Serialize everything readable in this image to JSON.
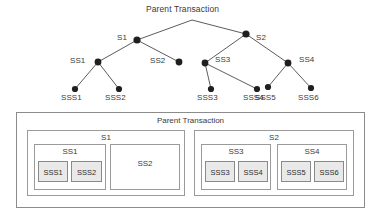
{
  "diagram": {
    "colors": {
      "node_fill": "#1f1f1f",
      "edge": "#4a4a4a",
      "text": "#3a3a3a",
      "box_border": "#8c8c8c",
      "leaf_fill": "#e9e9e9"
    },
    "tree": {
      "root": {
        "label": "Parent Transaction",
        "x": 192,
        "y": 20
      },
      "nodes": [
        {
          "id": "S1",
          "label": "S1",
          "x": 137,
          "y": 40,
          "label_x": 117,
          "label_y": 34
        },
        {
          "id": "S2",
          "label": "S2",
          "x": 246,
          "y": 34,
          "label_x": 256,
          "label_y": 36
        },
        {
          "id": "SS1",
          "label": "SS1",
          "x": 98,
          "y": 62,
          "label_x": 72,
          "label_y": 58
        },
        {
          "id": "SS2",
          "label": "SS2",
          "x": 179,
          "y": 62,
          "label_x": 152,
          "label_y": 58
        },
        {
          "id": "SS3",
          "label": "SS3",
          "x": 205,
          "y": 63,
          "label_x": 216,
          "label_y": 57
        },
        {
          "id": "SS4",
          "label": "SS4",
          "x": 288,
          "y": 63,
          "label_x": 300,
          "label_y": 57
        },
        {
          "id": "SSS1",
          "label": "SSS1",
          "x": 75,
          "y": 89,
          "label_x": 62,
          "label_y": 94
        },
        {
          "id": "SSS2",
          "label": "SSS2",
          "x": 119,
          "y": 89,
          "label_x": 106,
          "label_y": 94
        },
        {
          "id": "SSS3",
          "label": "SSS3",
          "x": 211,
          "y": 89,
          "label_x": 198,
          "label_y": 94
        },
        {
          "id": "SSS4",
          "label": "SSS4",
          "x": 257,
          "y": 89,
          "label_x": 244,
          "label_y": 94
        },
        {
          "id": "SSS5",
          "label": "SSS5",
          "x": 268,
          "y": 87,
          "label_x": 256,
          "label_y": 94
        },
        {
          "id": "SSS6",
          "label": "SSS6",
          "x": 311,
          "y": 88,
          "label_x": 299,
          "label_y": 94
        }
      ],
      "edges": [
        {
          "from": "root",
          "to": "S1"
        },
        {
          "from": "root",
          "to": "S2"
        },
        {
          "from": "S1",
          "to": "SS1"
        },
        {
          "from": "S1",
          "to": "SS2"
        },
        {
          "from": "S2",
          "to": "SS3"
        },
        {
          "from": "S2",
          "to": "SS4"
        },
        {
          "from": "SS1",
          "to": "SSS1"
        },
        {
          "from": "SS1",
          "to": "SSS2"
        },
        {
          "from": "SS3",
          "to": "SSS3"
        },
        {
          "from": "SS3",
          "to": "SSS4"
        },
        {
          "from": "SS4",
          "to": "SSS5"
        },
        {
          "from": "SS4",
          "to": "SSS6"
        }
      ]
    },
    "containment": {
      "outer_label": "Parent Transaction",
      "groups": [
        {
          "label": "S1",
          "children": [
            {
              "label": "SS1",
              "leaves": [
                "SSS1",
                "SSS2"
              ]
            },
            {
              "label": "SS2",
              "leaves": []
            }
          ]
        },
        {
          "label": "S2",
          "children": [
            {
              "label": "SS3",
              "leaves": [
                "SSS3",
                "SSS4"
              ]
            },
            {
              "label": "SS4",
              "leaves": [
                "SSS5",
                "SSS6"
              ]
            }
          ]
        }
      ]
    }
  }
}
